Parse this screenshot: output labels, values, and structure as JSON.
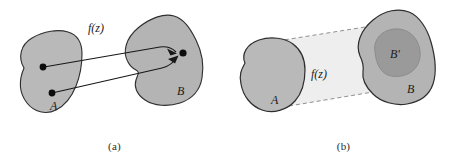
{
  "figure": {
    "caption_a": "(a)",
    "caption_b": "(b)",
    "colors": {
      "blob_fill": "#b9b9b9",
      "blob_fill_b": "#b4b4b4",
      "inner_fill": "#9a9a9a",
      "cone_fill": "#eeeeee",
      "outline": "#2e2e2e",
      "dashed": "#8a8a8a",
      "background": "#ffffff",
      "text": "#1a1a1a"
    }
  },
  "panel_a": {
    "name": "pointwise-mapping",
    "function_label": "f(z)",
    "domain_label": "A",
    "codomain_label": "B",
    "points": {
      "source_upper": "dot",
      "source_lower": "dot",
      "target": "dot"
    },
    "arrows": [
      {
        "name": "arrow-upper",
        "from": "A upper point",
        "to": "B point"
      },
      {
        "name": "arrow-lower",
        "from": "A lower point",
        "to": "B point"
      }
    ]
  },
  "panel_b": {
    "name": "set-image-mapping",
    "function_label": "f(z)",
    "domain_label": "A",
    "codomain_label": "B",
    "image_label": "B'",
    "cone": {
      "name": "mapping-cone",
      "style": "dashed-outline"
    }
  }
}
